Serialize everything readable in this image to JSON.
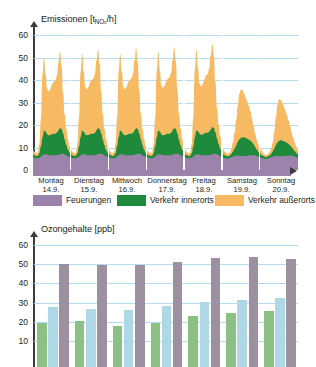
{
  "emissions": {
    "axis_title_main": "Emissionen [t",
    "axis_title_sub": "NO",
    "axis_title_sub2": "x",
    "axis_title_tail": "/h]",
    "axis_title_full": "Emissionen [tNOx/h]",
    "yticks": [
      "60",
      "50",
      "40",
      "30",
      "20",
      "10",
      "0"
    ],
    "days": [
      {
        "name": "Montag",
        "date": "14.9."
      },
      {
        "name": "Dienstag",
        "date": "15.9."
      },
      {
        "name": "Mittwoch",
        "date": "16.9."
      },
      {
        "name": "Donnerstag",
        "date": "17.9."
      },
      {
        "name": "Freitag",
        "date": "18.9."
      },
      {
        "name": "Samstag",
        "date": "19.9."
      },
      {
        "name": "Sonntag",
        "date": "20.9."
      }
    ]
  },
  "legend": {
    "items": [
      {
        "label": "Feuerungen",
        "color": "#9b83ac"
      },
      {
        "label": "Verkehr innerorts",
        "color": "#1f8a3b"
      },
      {
        "label": "Verkehr außerorts",
        "color": "#f7b961"
      }
    ]
  },
  "ozone": {
    "axis_title": "Ozongehalte [ppb]",
    "yticks": [
      "60",
      "50",
      "40",
      "30",
      "20",
      "10"
    ]
  },
  "colors": {
    "feuerungen": "#9b83ac",
    "verkehr_innerorts": "#1f8a3b",
    "verkehr_ausserorts": "#f7b961",
    "ozone_green": "#8cc084",
    "ozone_blue": "#aed8e6",
    "ozone_gray": "#9d90a0",
    "gridline": "#b6dcef",
    "axis": "#3c3c3c"
  },
  "chart_data": [
    {
      "type": "area",
      "title": "Emissionen [tNOx/h]",
      "xlabel": "",
      "ylabel": "Emissionen [tNOx/h]",
      "ylim": [
        0,
        60
      ],
      "yticks": [
        0,
        10,
        20,
        30,
        40,
        50,
        60
      ],
      "grid": true,
      "stacked": true,
      "legend_position": "below-axis",
      "x": [
        "Montag 14.9.",
        "Dienstag 15.9.",
        "Mittwoch 16.9.",
        "Donnerstag 17.9.",
        "Freitag 18.9.",
        "Samstag 19.9.",
        "Sonntag 20.9."
      ],
      "x_hours_per_day": 24,
      "series": [
        {
          "name": "Feuerungen",
          "color": "#9b83ac",
          "values_per_day": [
            [
              5.5,
              5.3,
              5.2,
              5.2,
              5.4,
              6.0,
              6.6,
              7.0,
              7.0,
              6.8,
              6.6,
              6.5,
              6.5,
              6.5,
              6.5,
              6.6,
              6.8,
              7.0,
              7.2,
              7.2,
              7.0,
              6.6,
              6.1,
              5.7
            ],
            [
              5.5,
              5.3,
              5.2,
              5.2,
              5.4,
              6.0,
              6.6,
              7.0,
              7.0,
              6.8,
              6.6,
              6.5,
              6.5,
              6.5,
              6.5,
              6.6,
              6.8,
              7.0,
              7.2,
              7.2,
              7.0,
              6.6,
              6.1,
              5.7
            ],
            [
              5.5,
              5.3,
              5.2,
              5.2,
              5.4,
              6.0,
              6.6,
              7.0,
              7.0,
              6.8,
              6.6,
              6.5,
              6.5,
              6.5,
              6.5,
              6.6,
              6.8,
              7.0,
              7.2,
              7.2,
              7.0,
              6.6,
              6.1,
              5.7
            ],
            [
              5.5,
              5.3,
              5.2,
              5.2,
              5.4,
              6.0,
              6.6,
              7.0,
              7.0,
              6.8,
              6.6,
              6.5,
              6.5,
              6.5,
              6.5,
              6.6,
              6.8,
              7.0,
              7.2,
              7.2,
              7.0,
              6.6,
              6.1,
              5.7
            ],
            [
              5.5,
              5.3,
              5.2,
              5.2,
              5.4,
              6.0,
              6.6,
              7.0,
              7.0,
              6.8,
              6.6,
              6.5,
              6.5,
              6.5,
              6.5,
              6.6,
              6.8,
              7.0,
              7.2,
              7.2,
              7.0,
              6.6,
              6.1,
              5.7
            ],
            [
              5.4,
              5.2,
              5.1,
              5.1,
              5.2,
              5.5,
              5.9,
              6.2,
              6.4,
              6.4,
              6.3,
              6.2,
              6.2,
              6.2,
              6.2,
              6.3,
              6.4,
              6.5,
              6.6,
              6.6,
              6.4,
              6.1,
              5.8,
              5.5
            ],
            [
              5.3,
              5.1,
              5.0,
              5.0,
              5.1,
              5.3,
              5.6,
              5.9,
              6.1,
              6.2,
              6.2,
              6.1,
              6.1,
              6.1,
              6.1,
              6.2,
              6.2,
              6.3,
              6.4,
              6.3,
              6.2,
              5.9,
              5.6,
              5.4
            ]
          ]
        },
        {
          "name": "Verkehr innerorts",
          "color": "#1f8a3b",
          "values_per_day": [
            [
              1.5,
              1.2,
              1.0,
              1.1,
              2.0,
              4.5,
              8.0,
              10.5,
              10.0,
              9.0,
              8.8,
              9.0,
              9.5,
              9.6,
              9.6,
              10.0,
              10.8,
              11.5,
              11.0,
              9.0,
              6.5,
              4.5,
              3.0,
              2.0
            ],
            [
              1.5,
              1.2,
              1.0,
              1.1,
              2.0,
              4.5,
              8.0,
              10.5,
              10.0,
              9.0,
              8.8,
              9.0,
              9.5,
              9.6,
              9.6,
              10.0,
              10.8,
              11.5,
              11.0,
              9.0,
              6.5,
              4.5,
              3.0,
              2.0
            ],
            [
              1.5,
              1.2,
              1.0,
              1.1,
              2.0,
              4.5,
              8.0,
              10.5,
              10.0,
              9.0,
              8.8,
              9.0,
              9.5,
              9.6,
              9.6,
              10.0,
              10.8,
              11.5,
              11.0,
              9.0,
              6.5,
              4.5,
              3.0,
              2.0
            ],
            [
              1.5,
              1.2,
              1.0,
              1.1,
              2.0,
              4.5,
              8.0,
              10.5,
              10.0,
              9.0,
              8.8,
              9.0,
              9.5,
              9.6,
              9.6,
              10.0,
              10.8,
              11.5,
              11.0,
              9.0,
              6.5,
              4.5,
              3.0,
              2.0
            ],
            [
              1.5,
              1.2,
              1.0,
              1.1,
              2.0,
              4.5,
              8.0,
              10.5,
              10.2,
              9.3,
              9.0,
              9.3,
              9.8,
              10.0,
              10.0,
              10.4,
              11.2,
              12.0,
              11.5,
              9.5,
              7.0,
              5.0,
              3.5,
              2.2
            ],
            [
              1.6,
              1.3,
              1.1,
              1.0,
              1.2,
              1.6,
              2.3,
              3.2,
              4.5,
              6.0,
              7.3,
              8.0,
              8.3,
              8.3,
              8.0,
              7.6,
              7.2,
              6.6,
              5.8,
              4.8,
              3.8,
              3.0,
              2.3,
              1.8
            ],
            [
              1.4,
              1.1,
              0.9,
              0.8,
              0.9,
              1.1,
              1.5,
              2.2,
              3.4,
              4.8,
              6.0,
              6.8,
              7.1,
              7.0,
              6.7,
              6.3,
              5.9,
              5.3,
              4.6,
              3.8,
              3.0,
              2.4,
              1.9,
              1.5
            ]
          ]
        },
        {
          "name": "Verkehr außerorts",
          "color": "#f7b961",
          "values_per_day": [
            [
              2.0,
              1.5,
              1.2,
              1.5,
              4.0,
              12.0,
              28.0,
              32.5,
              25.0,
              20.0,
              19.5,
              20.5,
              22.0,
              23.0,
              23.5,
              25.0,
              30.0,
              34.0,
              28.0,
              18.0,
              11.0,
              7.0,
              4.5,
              3.0
            ],
            [
              2.0,
              1.5,
              1.2,
              1.5,
              4.0,
              12.5,
              29.0,
              34.0,
              26.5,
              21.0,
              20.5,
              21.5,
              23.0,
              24.0,
              24.5,
              26.0,
              31.0,
              35.0,
              29.0,
              19.0,
              11.5,
              7.2,
              4.6,
              3.0
            ],
            [
              2.0,
              1.5,
              1.2,
              1.5,
              4.0,
              12.5,
              29.0,
              34.0,
              26.5,
              21.0,
              20.5,
              21.5,
              23.0,
              24.0,
              24.5,
              26.0,
              31.0,
              35.5,
              29.5,
              19.0,
              11.5,
              7.2,
              4.6,
              3.0
            ],
            [
              2.0,
              1.5,
              1.2,
              1.5,
              4.0,
              12.5,
              29.5,
              35.0,
              27.0,
              21.5,
              21.0,
              22.0,
              23.5,
              24.5,
              25.0,
              26.5,
              31.5,
              36.0,
              30.0,
              19.5,
              11.8,
              7.4,
              4.7,
              3.1
            ],
            [
              2.0,
              1.5,
              1.2,
              1.5,
              4.0,
              13.0,
              30.0,
              36.0,
              28.0,
              22.0,
              21.5,
              22.5,
              24.0,
              25.5,
              26.0,
              28.0,
              33.0,
              37.0,
              32.0,
              22.0,
              13.5,
              8.5,
              5.5,
              3.5
            ],
            [
              2.0,
              1.6,
              1.2,
              1.0,
              1.3,
              2.2,
              4.0,
              7.0,
              11.0,
              16.0,
              20.0,
              21.5,
              21.0,
              19.5,
              18.0,
              16.5,
              15.0,
              13.0,
              10.5,
              8.0,
              6.0,
              4.5,
              3.2,
              2.3
            ],
            [
              1.8,
              1.4,
              1.0,
              0.9,
              1.0,
              1.4,
              2.2,
              4.0,
              7.5,
              12.0,
              16.5,
              18.5,
              18.0,
              17.0,
              15.5,
              14.0,
              12.5,
              10.5,
              8.5,
              6.5,
              5.0,
              3.8,
              2.8,
              2.0
            ]
          ]
        }
      ],
      "daily_totals_peak": [
        52,
        53,
        53.5,
        54.5,
        55.5,
        36,
        32
      ]
    },
    {
      "type": "bar",
      "title": "Ozongehalte [ppb]",
      "xlabel": "",
      "ylabel": "Ozongehalte [ppb]",
      "ylim": [
        0,
        60
      ],
      "yticks": [
        10,
        20,
        30,
        40,
        50,
        60
      ],
      "grid": true,
      "categories": [
        "Montag 14.9.",
        "Dienstag 15.9.",
        "Mittwoch 16.9.",
        "Donnerstag 17.9.",
        "Freitag 18.9.",
        "Samstag 19.9.",
        "Sonntag 20.9."
      ],
      "series": [
        {
          "name": "grün",
          "color": "#8cc084",
          "values": [
            19.5,
            20.5,
            18.0,
            19.5,
            23.0,
            24.5,
            25.5
          ]
        },
        {
          "name": "blau",
          "color": "#aed8e6",
          "values": [
            27.5,
            26.5,
            26.0,
            28.0,
            30.5,
            31.5,
            32.5
          ]
        },
        {
          "name": "grau",
          "color": "#9d90a0",
          "values": [
            50.0,
            49.5,
            49.5,
            51.0,
            53.0,
            54.0,
            52.5
          ]
        }
      ]
    }
  ]
}
